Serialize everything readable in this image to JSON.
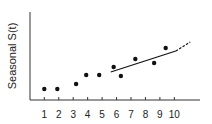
{
  "chart_data": {
    "type": "scatter",
    "title": "",
    "xlabel": "",
    "ylabel": "Seasonal S(t)",
    "x_ticks": [
      "1",
      "2",
      "3",
      "4",
      "5",
      "6",
      "7",
      "8",
      "9",
      "10"
    ],
    "xlim": [
      0,
      11.2
    ],
    "ylim": [
      0,
      8.8
    ],
    "grid": false,
    "legend": null,
    "series": [
      {
        "name": "observations",
        "kind": "points",
        "x": [
          1.0,
          1.9,
          3.2,
          3.9,
          4.8,
          5.8,
          6.3,
          7.3,
          8.6,
          9.4
        ],
        "y": [
          1.1,
          1.1,
          1.6,
          2.5,
          2.5,
          3.3,
          2.4,
          4.1,
          3.7,
          5.2
        ]
      },
      {
        "name": "trend-solid",
        "kind": "line",
        "style": "solid",
        "x": [
          5.6,
          10.1
        ],
        "y": [
          2.8,
          4.9
        ]
      },
      {
        "name": "trend-extrapolated",
        "kind": "line",
        "style": "dashed",
        "x": [
          10.1,
          11.1
        ],
        "y": [
          4.9,
          5.8
        ]
      }
    ]
  }
}
